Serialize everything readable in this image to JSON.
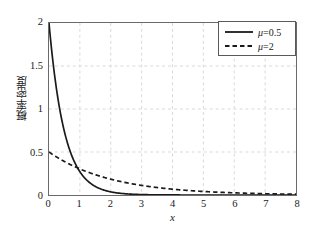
{
  "chart_data": {
    "type": "line",
    "title": "",
    "xlabel": "x",
    "ylabel": "概率密度",
    "xlim": [
      0,
      8
    ],
    "ylim": [
      0,
      2
    ],
    "xticks": [
      "0",
      "1",
      "2",
      "3",
      "4",
      "5",
      "6",
      "7",
      "8"
    ],
    "yticks": [
      "0",
      "0.5",
      "1",
      "1.5",
      "2"
    ],
    "xtick_values": [
      0,
      1,
      2,
      3,
      4,
      5,
      6,
      7,
      8
    ],
    "ytick_values": [
      0,
      0.5,
      1,
      1.5,
      2
    ],
    "grid": true,
    "grid_style": "dashed",
    "grid_color": "#d9d9d9",
    "axes_color": "#6a6a6a",
    "legend_position": "top-right",
    "series": [
      {
        "name": "μ=0.5",
        "mu": 0.5,
        "rate": 2,
        "style": "solid",
        "color": "#1a1a1a",
        "x": [
          0,
          0.1,
          0.2,
          0.3,
          0.4,
          0.5,
          0.6,
          0.7,
          0.8,
          0.9,
          1,
          1.2,
          1.4,
          1.6,
          1.8,
          2,
          2.25,
          2.5,
          2.75,
          3,
          3.5,
          4,
          4.5,
          5,
          5.5,
          6,
          6.5,
          7,
          7.5,
          8
        ],
        "values": [
          2,
          1.637,
          1.341,
          1.098,
          0.899,
          0.736,
          0.602,
          0.493,
          0.404,
          0.331,
          0.271,
          0.181,
          0.122,
          0.082,
          0.055,
          0.037,
          0.022,
          0.013,
          0.008,
          0.005,
          0.002,
          0.001,
          0,
          0,
          0,
          0,
          0,
          0,
          0,
          0
        ]
      },
      {
        "name": "μ=2",
        "mu": 2,
        "rate": 0.5,
        "style": "dashed",
        "color": "#1a1a1a",
        "x": [
          0,
          0.25,
          0.5,
          0.75,
          1,
          1.25,
          1.5,
          1.75,
          2,
          2.5,
          3,
          3.5,
          4,
          4.5,
          5,
          5.5,
          6,
          6.5,
          7,
          7.5,
          8
        ],
        "values": [
          0.5,
          0.441,
          0.389,
          0.343,
          0.303,
          0.268,
          0.236,
          0.208,
          0.184,
          0.143,
          0.112,
          0.087,
          0.068,
          0.053,
          0.041,
          0.032,
          0.025,
          0.019,
          0.015,
          0.012,
          0.009
        ]
      }
    ]
  },
  "legend": {
    "entries": [
      {
        "label": "μ=0.5",
        "style": "solid"
      },
      {
        "label": "μ=2",
        "style": "dashed"
      }
    ]
  }
}
